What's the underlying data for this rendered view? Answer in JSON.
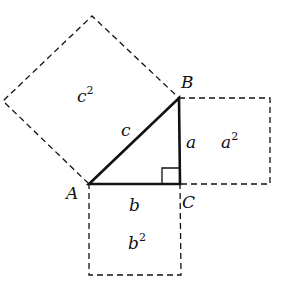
{
  "vertices": {
    "A": {
      "label": "A",
      "x": 89,
      "y": 184
    },
    "B": {
      "label": "B",
      "x": 179,
      "y": 98
    },
    "C": {
      "label": "C",
      "x": 180,
      "y": 184
    }
  },
  "sides": {
    "a": {
      "label": "a"
    },
    "b": {
      "label": "b"
    },
    "c": {
      "label": "c"
    }
  },
  "squares": {
    "a2": {
      "base": "a",
      "exp": "2"
    },
    "b2": {
      "base": "b",
      "exp": "2"
    },
    "c2": {
      "base": "c",
      "exp": "2"
    }
  },
  "colors": {
    "stroke": "#111111",
    "background": "#ffffff"
  }
}
